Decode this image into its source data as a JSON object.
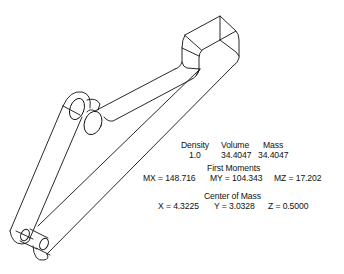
{
  "figure": {
    "stroke_color": "#111111",
    "background": "#ffffff"
  },
  "properties": {
    "headers": {
      "density": "Density",
      "volume": "Volume",
      "mass": "Mass"
    },
    "values": {
      "density": "1.0",
      "volume": "34.4047",
      "mass": "34.4047"
    },
    "first_moments": {
      "title": "First Moments",
      "mx": "MX = 148.716",
      "my": "MY = 104.343",
      "mz": "MZ = 17.202"
    },
    "center_of_mass": {
      "title": "Center of Mass",
      "x": "X = 4.3225",
      "y": "Y = 3.0328",
      "z": "Z = 0.5000"
    }
  }
}
